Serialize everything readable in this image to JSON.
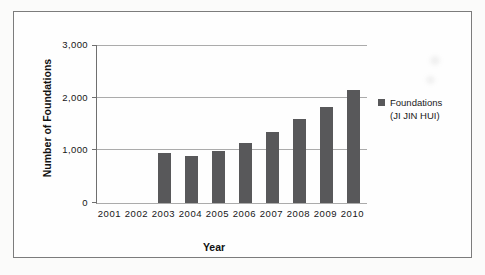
{
  "chart_data": {
    "type": "bar",
    "title": "",
    "xlabel": "Year",
    "ylabel": "Number of Foundations",
    "categories": [
      "2001",
      "2002",
      "2003",
      "2004",
      "2005",
      "2006",
      "2007",
      "2008",
      "2009",
      "2010"
    ],
    "values": [
      0,
      0,
      950,
      890,
      980,
      1140,
      1340,
      1590,
      1830,
      2140
    ],
    "ylim": [
      0,
      3000
    ],
    "yticks": [
      0,
      1000,
      2000,
      3000
    ],
    "ytick_labels": [
      "0",
      "1,000",
      "2,000",
      "3,000"
    ],
    "grid": true,
    "bar_color": "#58585a",
    "gridline_color": "#ababab",
    "legend": {
      "position": "right",
      "marker_color": "#58585a",
      "lines": [
        "Foundations",
        "(JI JIN HUI)"
      ]
    }
  }
}
